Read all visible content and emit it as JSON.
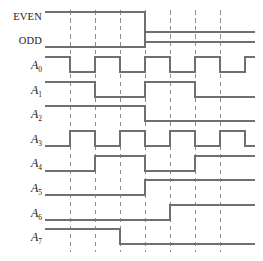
{
  "figure": {
    "type": "timing-diagram",
    "title": "",
    "background_color": "#ffffff",
    "waveform_color": "#6f6f6f",
    "gridline_color": "#8c8c8c",
    "label_color": "#1a1a1a"
  },
  "geometry": {
    "width": 263,
    "height": 261,
    "wave_left_x": 45,
    "wave_right_x": 255,
    "division_width": 25,
    "division_count": 8.4,
    "gridline_x_positions": [
      70,
      95,
      120,
      145,
      170,
      195,
      220
    ],
    "row_pitch": 24.6,
    "row_first_high_y": 12,
    "signal_amplitude": 12
  },
  "signals": [
    {
      "name": "EVEN",
      "label": "EVEN",
      "label_kind": "word",
      "subscript": "",
      "row": 0,
      "high_y": 12,
      "low_y": 42,
      "initial_level": 1,
      "transitions": [
        4.0
      ],
      "levels": [
        1,
        0
      ],
      "description": "High for first four divisions, low thereafter"
    },
    {
      "name": "ODD",
      "label": "ODD",
      "label_kind": "word",
      "subscript": "",
      "row": 1,
      "high_y": 32,
      "low_y": 47,
      "initial_level": 0,
      "transitions": [
        4.0
      ],
      "levels": [
        0,
        1
      ],
      "description": "Low for first four divisions, high thereafter"
    },
    {
      "name": "A0",
      "label": "A",
      "label_kind": "italic",
      "subscript": "0",
      "row": 2,
      "high_y": 57,
      "low_y": 72,
      "initial_level": 1,
      "transitions": [
        1.0,
        2.0,
        3.0,
        4.0,
        5.0,
        6.0,
        7.0,
        8.0
      ],
      "levels": [
        1,
        0,
        1,
        0,
        1,
        0,
        1,
        0,
        1
      ],
      "description": "Toggles every division, starting high"
    },
    {
      "name": "A1",
      "label": "A",
      "label_kind": "italic",
      "subscript": "1",
      "row": 3,
      "high_y": 82,
      "low_y": 97,
      "initial_level": 1,
      "transitions": [
        2.0,
        4.0,
        6.0
      ],
      "levels": [
        1,
        0,
        1,
        0
      ],
      "description": "Toggles every two divisions, starting high"
    },
    {
      "name": "A2",
      "label": "A",
      "label_kind": "italic",
      "subscript": "2",
      "row": 4,
      "high_y": 106,
      "low_y": 121,
      "initial_level": 1,
      "transitions": [
        4.0
      ],
      "levels": [
        1,
        0
      ],
      "description": "High for first four divisions, low thereafter"
    },
    {
      "name": "A3",
      "label": "A",
      "label_kind": "italic",
      "subscript": "3",
      "row": 5,
      "high_y": 131,
      "low_y": 146,
      "initial_level": 0,
      "transitions": [
        1.0,
        2.0,
        3.0,
        4.0,
        5.0,
        6.0,
        7.0,
        8.0
      ],
      "levels": [
        0,
        1,
        0,
        1,
        0,
        1,
        0,
        1,
        0
      ],
      "description": "Complement of A0; toggles every division, starting low"
    },
    {
      "name": "A4",
      "label": "A",
      "label_kind": "italic",
      "subscript": "4",
      "row": 6,
      "high_y": 156,
      "low_y": 171,
      "initial_level": 0,
      "transitions": [
        2.0,
        4.0,
        6.0
      ],
      "levels": [
        0,
        1,
        0,
        1
      ],
      "description": "Complement of A1; toggles every two divisions, starting low"
    },
    {
      "name": "A5",
      "label": "A",
      "label_kind": "italic",
      "subscript": "5",
      "row": 7,
      "high_y": 180,
      "low_y": 195,
      "initial_level": 0,
      "transitions": [
        4.0
      ],
      "levels": [
        0,
        1
      ],
      "description": "Complement of A2; low for first four divisions, high thereafter"
    },
    {
      "name": "A6",
      "label": "A",
      "label_kind": "italic",
      "subscript": "6",
      "row": 8,
      "high_y": 205,
      "low_y": 220,
      "initial_level": 0,
      "transitions": [
        5.0
      ],
      "levels": [
        0,
        1
      ],
      "description": "Low for first five divisions, high thereafter"
    },
    {
      "name": "A7",
      "label": "A",
      "label_kind": "italic",
      "subscript": "7",
      "row": 9,
      "high_y": 229,
      "low_y": 244,
      "initial_level": 1,
      "transitions": [
        3.0
      ],
      "levels": [
        1,
        0
      ],
      "description": "High for first three divisions, low thereafter"
    }
  ],
  "label_positions": [
    {
      "name": "EVEN",
      "x": 42,
      "y": 20
    },
    {
      "name": "ODD",
      "x": 42,
      "y": 44
    },
    {
      "name": "A0",
      "x": 42,
      "y": 69
    },
    {
      "name": "A1",
      "x": 42,
      "y": 94
    },
    {
      "name": "A2",
      "x": 42,
      "y": 118
    },
    {
      "name": "A3",
      "x": 42,
      "y": 143
    },
    {
      "name": "A4",
      "x": 42,
      "y": 167
    },
    {
      "name": "A5",
      "x": 42,
      "y": 192
    },
    {
      "name": "A6",
      "x": 42,
      "y": 217
    },
    {
      "name": "A7",
      "x": 42,
      "y": 241
    }
  ],
  "gridlines": {
    "top_y": 10,
    "bottom_y": 252,
    "x_positions": [
      70,
      95,
      120,
      145,
      170,
      195,
      220
    ]
  }
}
